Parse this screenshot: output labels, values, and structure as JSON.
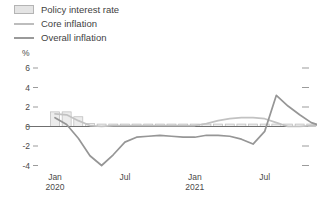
{
  "legend": {
    "items": [
      {
        "label": "Policy interest rate",
        "key": "policy-rate-swatch",
        "type": "box",
        "color": "#e4e4e4"
      },
      {
        "label": "Core inflation",
        "key": "core-line-swatch",
        "type": "line",
        "color": "#c2c2c2"
      },
      {
        "label": "Overall inflation",
        "key": "overall-line-swatch",
        "type": "line",
        "color": "#969696"
      }
    ]
  },
  "axes": {
    "y_unit": "%",
    "y_ticks": [
      "6",
      "4",
      "2",
      "0",
      "-2",
      "-4"
    ],
    "x_ticks": [
      {
        "month": "Jan",
        "year": "2020"
      },
      {
        "month": "Jul",
        "year": ""
      },
      {
        "month": "Jan",
        "year": "2021"
      },
      {
        "month": "Jul",
        "year": ""
      },
      {
        "month": "Jan",
        "year": "2022"
      }
    ]
  },
  "chart_data": {
    "type": "line",
    "title": "",
    "subtitle": "",
    "xlabel": "",
    "ylabel": "%",
    "ylim": [
      -5,
      7
    ],
    "grid": false,
    "legend_position": "top-left",
    "x": [
      "2020-01",
      "2020-02",
      "2020-03",
      "2020-04",
      "2020-05",
      "2020-06",
      "2020-07",
      "2020-08",
      "2020-09",
      "2020-10",
      "2020-11",
      "2020-12",
      "2021-01",
      "2021-02",
      "2021-03",
      "2021-04",
      "2021-05",
      "2021-06",
      "2021-07",
      "2021-08",
      "2021-09",
      "2021-10",
      "2021-11",
      "2021-12",
      "2022-01",
      "2022-02"
    ],
    "x_tick_labels": [
      "Jan 2020",
      "Jul",
      "Jan 2021",
      "Jul",
      "Jan 2022"
    ],
    "series": [
      {
        "name": "Policy interest rate",
        "type": "bar",
        "color": "#e4e4e4",
        "values": [
          1.5,
          1.5,
          1.0,
          0.3,
          0.25,
          0.25,
          0.25,
          0.25,
          0.25,
          0.25,
          0.25,
          0.25,
          0.25,
          0.25,
          0.25,
          0.25,
          0.25,
          0.25,
          0.25,
          0.25,
          0.25,
          0.25,
          0.25,
          0.3,
          0.4,
          0.5
        ]
      },
      {
        "name": "Core inflation",
        "type": "line",
        "color": "#c2c2c2",
        "values": [
          1.3,
          1.2,
          0.6,
          0.1,
          0.0,
          0.1,
          0.1,
          0.1,
          0.1,
          0.1,
          0.1,
          0.1,
          0.1,
          0.3,
          0.6,
          0.8,
          0.9,
          0.9,
          0.8,
          0.4,
          0.0,
          0.0,
          0.1,
          0.2,
          0.6,
          1.1
        ]
      },
      {
        "name": "Overall inflation",
        "type": "line",
        "color": "#969696",
        "values": [
          0.9,
          0.2,
          -1.2,
          -3.0,
          -4.0,
          -2.9,
          -1.6,
          -1.1,
          -1.0,
          -0.9,
          -1.0,
          -1.1,
          -1.1,
          -0.9,
          -0.9,
          -1.0,
          -1.3,
          -1.8,
          -0.5,
          3.2,
          2.1,
          1.2,
          0.4,
          0.0,
          0.1,
          0.3
        ]
      }
    ]
  }
}
